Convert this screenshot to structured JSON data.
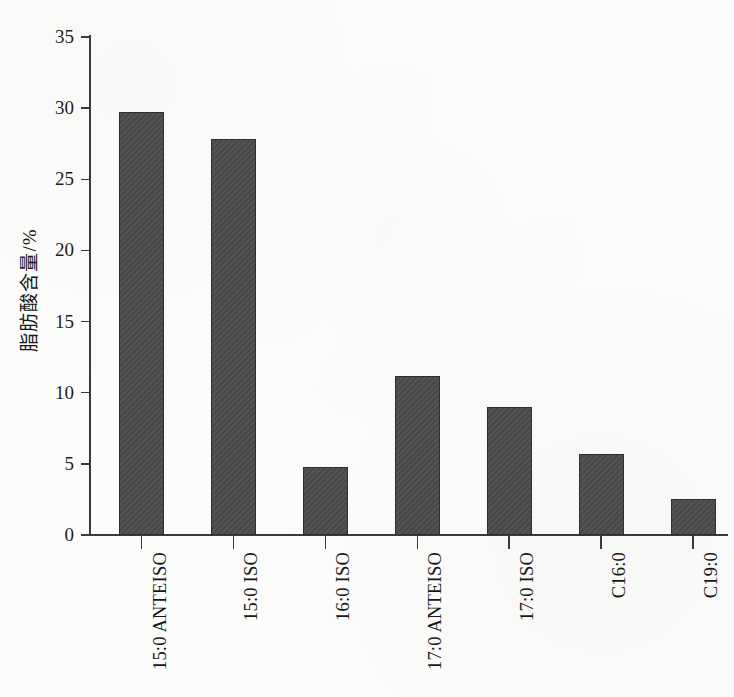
{
  "chart_data": {
    "type": "bar",
    "title": "",
    "xlabel": "",
    "ylabel": "脂肪酸含量/%",
    "ylim": [
      0,
      35
    ],
    "yticks": [
      0,
      5,
      10,
      15,
      20,
      25,
      30,
      35
    ],
    "grid": false,
    "legend": null,
    "categories": [
      "15:0 ANTEISO",
      "15:0 ISO",
      "16:0 ISO",
      "17:0 ANTEISO",
      "17:0 ISO",
      "C16:0",
      "C19:0"
    ],
    "values": [
      29.7,
      27.8,
      4.8,
      11.2,
      9.0,
      5.7,
      2.5
    ],
    "bar_color": "#4b4b4a",
    "bar_edge_color": "#2e2e2d",
    "axis_color": "#3a3a38",
    "background_color": "#fcfcfa"
  }
}
